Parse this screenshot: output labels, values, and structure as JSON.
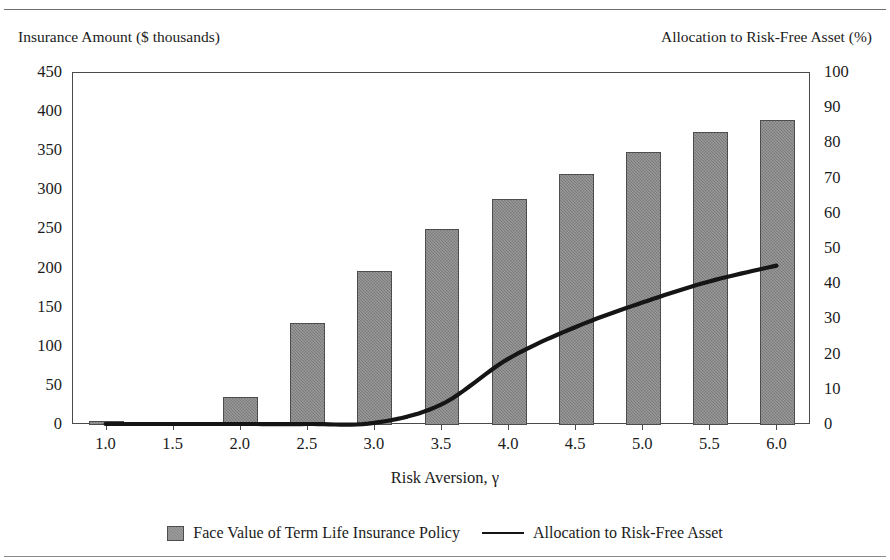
{
  "figure": {
    "cropped_title": "Insurance and Portfolio Allocation",
    "left_axis_caption": "Insurance Amount ($ thousands)",
    "right_axis_caption": "Allocation to Risk-Free Asset (%)"
  },
  "chart_data": {
    "type": "bar",
    "title": "",
    "xlabel": "Risk Aversion, γ",
    "ylabel": "Insurance Amount ($ thousands)",
    "y2label": "Allocation to Risk-Free Asset (%)",
    "categories": [
      "1.0",
      "1.5",
      "2.0",
      "2.5",
      "3.0",
      "3.5",
      "4.0",
      "4.5",
      "5.0",
      "5.5",
      "6.0"
    ],
    "ylim": [
      0,
      450
    ],
    "yticks": [
      0,
      50,
      100,
      150,
      200,
      250,
      300,
      350,
      400,
      450
    ],
    "y2lim": [
      0,
      100
    ],
    "y2ticks": [
      0,
      10,
      20,
      30,
      40,
      50,
      60,
      70,
      80,
      90,
      100
    ],
    "grid": false,
    "legend_position": "bottom",
    "series": [
      {
        "name": "Face Value of Term Life Insurance Policy",
        "kind": "bar",
        "axis": "left",
        "color": "#878787",
        "values": [
          5,
          4,
          36,
          130,
          197,
          251,
          289,
          321,
          349,
          374,
          390
        ]
      },
      {
        "name": "Allocation to Risk-Free Asset",
        "kind": "line",
        "axis": "right",
        "color": "#151515",
        "values": [
          0,
          0,
          0,
          0,
          0.3,
          5.5,
          18.5,
          27.5,
          34.5,
          40.5,
          45
        ]
      }
    ]
  },
  "legend": {
    "entries": [
      {
        "label": "Face Value of Term Life Insurance Policy",
        "marker": "bar-swatch"
      },
      {
        "label": "Allocation to Risk-Free Asset",
        "marker": "line-swatch"
      }
    ]
  }
}
